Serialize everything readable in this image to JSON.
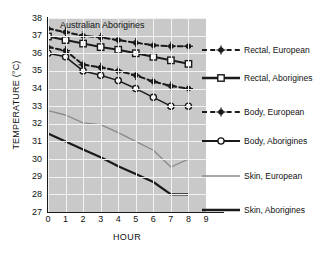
{
  "chart_data": {
    "type": "line",
    "title": "Australian Aborigines",
    "xlabel": "HOUR",
    "ylabel": "TEMPERATURE (°C)",
    "xlim": [
      0,
      9
    ],
    "ylim": [
      27,
      38
    ],
    "xticks": [
      "0",
      "1",
      "2",
      "3",
      "4",
      "5",
      "6",
      "7",
      "8",
      "9"
    ],
    "yticks": [
      "27",
      "28",
      "29",
      "30",
      "31",
      "32",
      "33",
      "34",
      "35",
      "36",
      "37",
      "38"
    ],
    "grid": true,
    "legend_position": "right",
    "plot_background": "#c9c9c9",
    "gridline_color": "#f2f2f2",
    "x": [
      0,
      1,
      2,
      3,
      4,
      5,
      6,
      7,
      8
    ],
    "series": [
      {
        "name": "Rectal, European",
        "values": [
          37.4,
          37.2,
          37.0,
          36.9,
          36.75,
          36.6,
          36.45,
          36.4,
          36.4
        ],
        "color": "#1a1a1a",
        "linestyle": "dashed",
        "marker": "spoked-circle",
        "linewidth": 2
      },
      {
        "name": "Rectal, Aborigines",
        "values": [
          36.95,
          36.75,
          36.55,
          36.35,
          36.2,
          36.0,
          35.8,
          35.6,
          35.4
        ],
        "color": "#1a1a1a",
        "linestyle": "solid",
        "marker": "open-square",
        "linewidth": 2
      },
      {
        "name": "Body, European",
        "values": [
          36.35,
          36.15,
          35.35,
          35.2,
          35.0,
          34.75,
          34.4,
          34.15,
          34.0
        ],
        "color": "#1a1a1a",
        "linestyle": "dashed",
        "marker": "spoked-circle",
        "linewidth": 2
      },
      {
        "name": "Body, Aborigines",
        "values": [
          36.0,
          35.8,
          35.0,
          34.75,
          34.45,
          34.0,
          33.5,
          33.0,
          33.0
        ],
        "color": "#1a1a1a",
        "linestyle": "solid",
        "marker": "open-circle",
        "linewidth": 1.5
      },
      {
        "name": "Skin, European",
        "values": [
          32.75,
          32.5,
          32.05,
          31.95,
          31.5,
          31.0,
          30.5,
          29.55,
          30.0
        ],
        "color": "#8a8a8a",
        "linestyle": "solid",
        "marker": "none",
        "linewidth": 1.3
      },
      {
        "name": "Skin, Aborigines",
        "values": [
          31.45,
          31.0,
          30.55,
          30.1,
          29.6,
          29.15,
          28.7,
          28.0,
          28.0
        ],
        "color": "#1a1a1a",
        "linestyle": "solid",
        "marker": "none",
        "linewidth": 2.2
      }
    ]
  },
  "legend": {
    "entries": [
      {
        "label": "Rectal, European",
        "y": 26,
        "style": "dashed",
        "marker": "spoked-circle",
        "color": "#1a1a1a",
        "width": 2
      },
      {
        "label": "Rectal, Aborigines",
        "y": 54,
        "style": "solid",
        "marker": "open-square",
        "color": "#1a1a1a",
        "width": 2.6
      },
      {
        "label": "Body, European",
        "y": 88,
        "style": "dashed",
        "marker": "spoked-circle",
        "color": "#1a1a1a",
        "width": 2
      },
      {
        "label": "Body, Aborigines",
        "y": 117,
        "style": "solid",
        "marker": "open-circle",
        "color": "#1a1a1a",
        "width": 2.2
      },
      {
        "label": "Skin, European",
        "y": 152,
        "style": "solid",
        "marker": "none",
        "color": "#8a8a8a",
        "width": 1.3
      },
      {
        "label": "Skin, Aborigines",
        "y": 186,
        "style": "solid",
        "marker": "none",
        "color": "#1a1a1a",
        "width": 2.6
      }
    ]
  }
}
